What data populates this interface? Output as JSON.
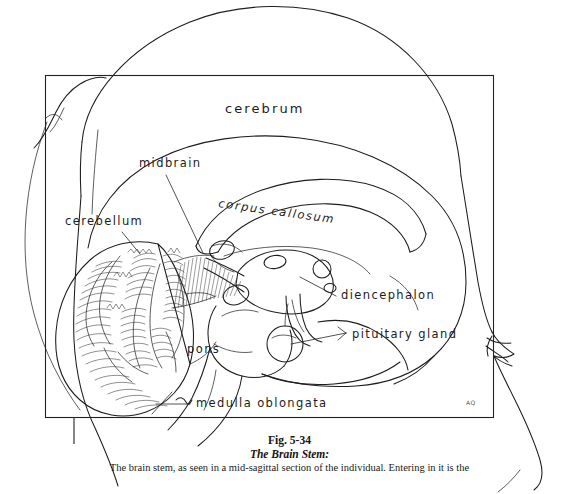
{
  "figure": {
    "title_line1": "Fig. 5-34",
    "title_line2": "The Brain Stem:",
    "body_line1": "The brain stem, as seen in a mid-sagittal section of the individual. Entering in it is the",
    "artist_signature": "AQ"
  },
  "diagram": {
    "type": "line-drawing",
    "labels": [
      {
        "id": "cerebrum",
        "text": "cerebrum",
        "x": 225,
        "y": 113,
        "style": "large",
        "leader": false
      },
      {
        "id": "midbrain",
        "text": "midbrain",
        "x": 139,
        "y": 167,
        "style": "normal",
        "leader": true
      },
      {
        "id": "corpus-callosum",
        "text": "corpus  callosum",
        "x": 218,
        "y": 207,
        "style": "italic",
        "leader": false
      },
      {
        "id": "cerebellum",
        "text": "cerebellum",
        "x": 65,
        "y": 225,
        "style": "normal",
        "leader": true
      },
      {
        "id": "diencephalon",
        "text": "diencephalon",
        "x": 341,
        "y": 299,
        "style": "normal",
        "leader": true
      },
      {
        "id": "pituitary-gland",
        "text": "pituitary gland",
        "x": 352,
        "y": 338,
        "style": "normal",
        "leader": true
      },
      {
        "id": "pons",
        "text": "pons",
        "x": 187,
        "y": 353,
        "style": "normal",
        "leader": false
      },
      {
        "id": "medulla-oblongata",
        "text": "medulla oblongata",
        "x": 196,
        "y": 407,
        "style": "normal",
        "leader": true
      }
    ],
    "frame": {
      "x": 45,
      "y": 75,
      "width": 449,
      "height": 343
    }
  }
}
